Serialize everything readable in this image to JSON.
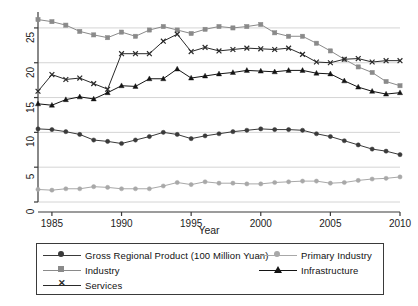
{
  "chart_data": {
    "type": "line",
    "title": "",
    "subtitle": "",
    "xlabel": "Year",
    "ylabel": "",
    "xlim": [
      1984,
      2010
    ],
    "ylim": [
      0,
      27
    ],
    "xticks": [
      1985,
      1990,
      1995,
      2000,
      2005,
      2010
    ],
    "yticks": [
      0,
      5,
      10,
      15,
      20,
      25
    ],
    "grid": "horizontal",
    "legend_position": "below-plot",
    "x": [
      1984,
      1985,
      1986,
      1987,
      1988,
      1989,
      1990,
      1991,
      1992,
      1993,
      1994,
      1995,
      1996,
      1997,
      1998,
      1999,
      2000,
      2001,
      2002,
      2003,
      2004,
      2005,
      2006,
      2007,
      2008,
      2009,
      2010
    ],
    "series": [
      {
        "name": "Gross Regional Product (100 Million Yuan)",
        "marker": "circle",
        "color": "#3a3a3a",
        "values": [
          10.5,
          10.4,
          10.1,
          9.7,
          8.9,
          8.7,
          8.4,
          8.9,
          9.4,
          10.0,
          9.7,
          9.1,
          9.5,
          9.8,
          10.1,
          10.3,
          10.5,
          10.4,
          10.4,
          10.3,
          9.8,
          9.4,
          8.8,
          8.2,
          7.6,
          7.3,
          6.8
        ]
      },
      {
        "name": "Industry",
        "marker": "square",
        "color": "#8a8a8a",
        "values": [
          26.2,
          25.9,
          25.4,
          24.5,
          24.0,
          23.6,
          24.4,
          23.8,
          24.7,
          25.2,
          24.7,
          24.2,
          24.8,
          25.2,
          25.0,
          25.2,
          25.5,
          24.3,
          23.8,
          23.8,
          22.8,
          21.7,
          20.5,
          19.4,
          18.6,
          17.3,
          16.7
        ]
      },
      {
        "name": "Services",
        "marker": "x",
        "color": "#2a2a2a",
        "values": [
          15.9,
          18.3,
          17.6,
          17.8,
          17.0,
          16.2,
          21.3,
          21.3,
          21.3,
          23.1,
          24.1,
          21.6,
          22.2,
          21.7,
          21.9,
          22.1,
          22.0,
          21.9,
          22.1,
          21.2,
          20.1,
          20.0,
          20.5,
          20.6,
          20.1,
          20.3,
          20.3
        ]
      },
      {
        "name": "Primary Industry",
        "marker": "circle",
        "color": "#a8a8a8",
        "values": [
          1.8,
          1.7,
          1.9,
          1.9,
          2.2,
          2.1,
          1.9,
          1.9,
          1.9,
          2.3,
          2.8,
          2.5,
          2.9,
          2.7,
          2.7,
          2.6,
          2.6,
          2.8,
          2.9,
          3.0,
          3.0,
          2.7,
          2.8,
          3.1,
          3.3,
          3.4,
          3.6
        ]
      },
      {
        "name": "Infrastructure",
        "marker": "triangle",
        "color": "#141414",
        "values": [
          14.1,
          13.9,
          14.7,
          15.1,
          14.8,
          15.7,
          16.7,
          16.6,
          17.7,
          17.7,
          19.1,
          17.8,
          18.1,
          18.4,
          18.6,
          18.9,
          18.8,
          18.7,
          18.9,
          18.9,
          18.5,
          18.4,
          17.4,
          16.5,
          15.9,
          15.5,
          15.7
        ]
      }
    ]
  },
  "axes": {
    "x_title": "Year",
    "x_tick_labels": [
      "1985",
      "1990",
      "1995",
      "2000",
      "2005",
      "2010"
    ],
    "y_tick_labels": [
      "0",
      "5",
      "10",
      "15",
      "20",
      "25"
    ]
  },
  "legend": {
    "column_left": [
      {
        "label": "Gross Regional Product (100 Million Yuan)",
        "marker": "circle",
        "color": "#3a3a3a"
      },
      {
        "label": "Industry",
        "marker": "square",
        "color": "#8a8a8a"
      },
      {
        "label": "Services",
        "marker": "x",
        "color": "#2a2a2a"
      }
    ],
    "column_right": [
      {
        "label": "Primary Industry",
        "marker": "circle",
        "color": "#a8a8a8"
      },
      {
        "label": "Infrastructure",
        "marker": "triangle",
        "color": "#141414"
      }
    ]
  },
  "colors": {
    "axis": "#3a3a3a",
    "grid": "#c9c9c9",
    "background": "#ffffff"
  }
}
